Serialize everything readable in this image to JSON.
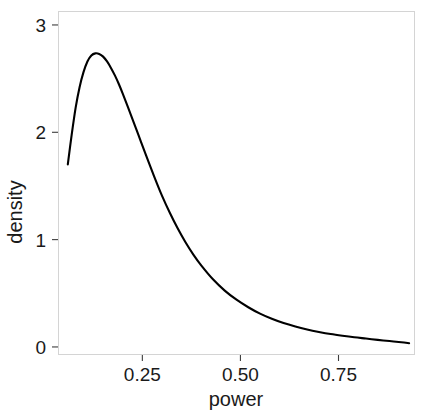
{
  "chart_data": {
    "type": "line",
    "title": "",
    "subtitle": "",
    "xlabel": "power",
    "ylabel": "density",
    "grid": false,
    "legend": null,
    "legend_position": "none",
    "xlim": [
      0.035,
      0.945
    ],
    "ylim": [
      -0.075,
      3.13
    ],
    "xticks": [
      0.25,
      0.5,
      0.75
    ],
    "xtick_labels": [
      "0.25",
      "0.50",
      "0.75"
    ],
    "yticks": [
      0,
      1,
      2,
      3
    ],
    "ytick_labels": [
      "0",
      "1",
      "2",
      "3"
    ],
    "series": [
      {
        "name": "density",
        "color": "#000000",
        "x": [
          0.06,
          0.07,
          0.08,
          0.09,
          0.1,
          0.11,
          0.12,
          0.13,
          0.14,
          0.15,
          0.16,
          0.17,
          0.18,
          0.19,
          0.2,
          0.22,
          0.24,
          0.26,
          0.28,
          0.3,
          0.32,
          0.34,
          0.36,
          0.38,
          0.4,
          0.43,
          0.46,
          0.49,
          0.52,
          0.55,
          0.58,
          0.61,
          0.64,
          0.67,
          0.7,
          0.73,
          0.76,
          0.79,
          0.82,
          0.85,
          0.88,
          0.91,
          0.93
        ],
        "y": [
          1.7,
          1.98,
          2.23,
          2.42,
          2.56,
          2.66,
          2.715,
          2.735,
          2.73,
          2.705,
          2.66,
          2.6,
          2.53,
          2.45,
          2.36,
          2.17,
          1.975,
          1.78,
          1.59,
          1.41,
          1.25,
          1.105,
          0.975,
          0.86,
          0.76,
          0.63,
          0.525,
          0.44,
          0.37,
          0.31,
          0.262,
          0.222,
          0.19,
          0.163,
          0.14,
          0.12,
          0.104,
          0.09,
          0.078,
          0.066,
          0.055,
          0.044,
          0.035
        ]
      }
    ]
  },
  "axes": {
    "x_title": "power",
    "y_title": "density"
  }
}
